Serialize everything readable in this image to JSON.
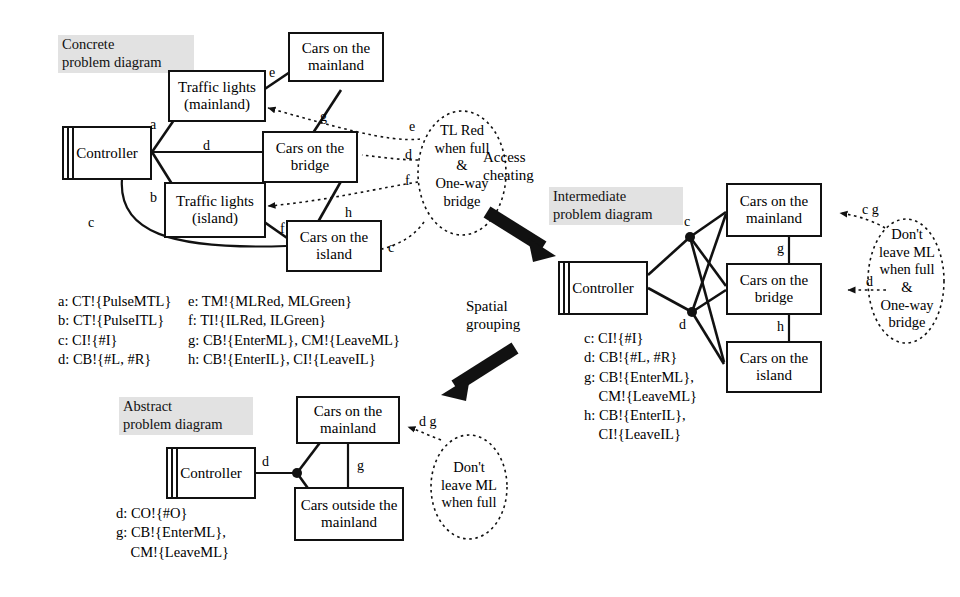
{
  "concrete": {
    "caption": "Concrete\nproblem diagram",
    "nodes": {
      "controller": "Controller",
      "traffic_lights_mainland": "Traffic lights\n(mainland)",
      "traffic_lights_island": "Traffic lights\n(island)",
      "cars_mainland": "Cars on the\nmainland",
      "cars_bridge": "Cars on the\nbridge",
      "cars_island": "Cars on the\nisland"
    },
    "edge_labels": {
      "a": "a",
      "b": "b",
      "c": "c",
      "d": "d",
      "e": "e",
      "f": "f",
      "g": "g",
      "h": "h",
      "req_e": "e",
      "req_d": "d",
      "req_f": "f",
      "req_c": "c"
    },
    "requirement": "TL Red\nwhen full\n&\nOne-way\nbridge",
    "legend_col1": "a: CT!{PulseMTL}\nb: CT!{PulseITL}\nc: CI!{#I}\nd: CB!{#L, #R}",
    "legend_col2": "e: TM!{MLRed, MLGreen}\nf: TI!{ILRed, ILGreen}\ng: CB!{EnterML}, CM!{LeaveML}\nh: CB!{EnterIL}, CI!{LeaveIL}"
  },
  "transitions": {
    "access_cheating": "Access\ncheating",
    "spatial_grouping": "Spatial\ngrouping"
  },
  "intermediate": {
    "caption": "Intermediate\nproblem diagram",
    "nodes": {
      "controller": "Controller",
      "cars_mainland": "Cars on the\nmainland",
      "cars_bridge": "Cars on the\nbridge",
      "cars_island": "Cars on the\nisland"
    },
    "edge_labels": {
      "c": "c",
      "d": "d",
      "g": "g",
      "h": "h",
      "req_cg": "c g",
      "req_d": "d"
    },
    "requirement": "Don't\nleave ML\nwhen full\n&\nOne-way\nbridge",
    "legend": "c: CI!{#I}\nd: CB!{#L, #R}\ng: CB!{EnterML},\n    CM!{LeaveML}\nh: CB!{EnterIL},\n    CI!{LeaveIL}"
  },
  "abstract": {
    "caption": "Abstract\nproblem diagram",
    "nodes": {
      "controller": "Controller",
      "cars_mainland": "Cars on the\nmainland",
      "cars_outside": "Cars outside\nthe mainland"
    },
    "edge_labels": {
      "d": "d",
      "g": "g",
      "req_dg": "d g"
    },
    "requirement": "Don't\nleave ML\nwhen full",
    "legend": "d: CO!{#O}\ng: CB!{EnterML},\n    CM!{LeaveML}"
  },
  "colors": {
    "line": "#111111",
    "caption_bg": "#e2e2e2",
    "background": "#ffffff"
  }
}
